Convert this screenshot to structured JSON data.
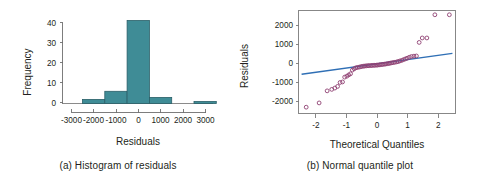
{
  "figure": {
    "background": "#ffffff",
    "bar_color": "#3f8c96",
    "bar_edge_color": "#2a5f68",
    "point_edge_color": "#8e3f72",
    "reference_line_color": "#2f6fb5",
    "axis_color": "#6f6f6f",
    "text_color": "#231f20"
  },
  "chart_data": [
    {
      "type": "bar",
      "panel": "a",
      "title": "",
      "caption": "(a) Histogram of residuals",
      "xlabel": "Residuals",
      "ylabel": "Frequency",
      "xlim": [
        -3500,
        3500
      ],
      "ylim": [
        0,
        43
      ],
      "grid": false,
      "legend": "none",
      "xticks": [
        -3000,
        -2000,
        -1000,
        0,
        1000,
        2000,
        3000
      ],
      "xtick_labels": [
        "-3000",
        "-2000",
        "-1000",
        "0",
        "1000",
        "2000",
        "3000"
      ],
      "yticks": [
        0,
        10,
        20,
        30,
        40
      ],
      "ytick_labels": [
        "0",
        "10",
        "20",
        "30",
        "40"
      ],
      "bin_width": 1000,
      "bin_edges": [
        -2500,
        -1500,
        -500,
        500,
        1500,
        2500,
        3500
      ],
      "categories": [
        "-2500 to -1500",
        "-1500 to -500",
        "-500 to 500",
        "500 to 1500",
        "1500 to 2500",
        "2500 to 3500"
      ],
      "values": [
        2,
        6,
        41,
        3,
        0,
        1
      ]
    },
    {
      "type": "scatter",
      "panel": "b",
      "title": "",
      "caption": "(b) Normal quantile plot",
      "xlabel": "Theoretical Quantiles",
      "ylabel": "Residuals",
      "xlim": [
        -2.55,
        2.55
      ],
      "ylim": [
        -2600,
        2950
      ],
      "grid": false,
      "legend": "none",
      "xticks": [
        -2,
        -1,
        0,
        1,
        2
      ],
      "xtick_labels": [
        "-2",
        "-1",
        "0",
        "1",
        "2"
      ],
      "yticks": [
        -2000,
        -1000,
        0,
        1000,
        2000
      ],
      "ytick_labels": [
        "-2000",
        "-1000",
        "0",
        "1000",
        "2000"
      ],
      "reference_line": {
        "x": [
          -2.45,
          2.45
        ],
        "y": [
          -480,
          640
        ]
      },
      "series": [
        {
          "name": "residual quantiles",
          "x": [
            -2.3,
            -1.88,
            -1.62,
            -1.47,
            -1.37,
            -1.28,
            -1.2,
            -1.12,
            -1.05,
            -0.98,
            -0.92,
            -0.86,
            -0.8,
            -0.74,
            -0.69,
            -0.64,
            -0.58,
            -0.53,
            -0.48,
            -0.43,
            -0.39,
            -0.34,
            -0.29,
            -0.25,
            -0.2,
            -0.16,
            -0.11,
            -0.07,
            -0.02,
            0.02,
            0.07,
            0.11,
            0.16,
            0.2,
            0.25,
            0.29,
            0.34,
            0.39,
            0.43,
            0.48,
            0.53,
            0.58,
            0.64,
            0.69,
            0.74,
            0.8,
            0.86,
            0.92,
            0.98,
            1.05,
            1.12,
            1.2,
            1.28,
            1.37,
            1.47,
            1.62,
            1.88,
            2.35
          ],
          "y": [
            -2260,
            -2030,
            -1380,
            -1300,
            -1230,
            -1140,
            -930,
            -900,
            -640,
            -590,
            -520,
            -460,
            -260,
            -190,
            -140,
            -120,
            -100,
            -80,
            -60,
            -50,
            -40,
            -30,
            -25,
            -20,
            -15,
            -10,
            -5,
            0,
            5,
            10,
            20,
            30,
            40,
            50,
            60,
            70,
            85,
            100,
            115,
            130,
            145,
            160,
            180,
            200,
            230,
            260,
            300,
            340,
            380,
            430,
            470,
            490,
            500,
            1230,
            1470,
            1470,
            2720,
            2720
          ]
        }
      ]
    }
  ],
  "panel_a": {
    "ylabel": "Frequency",
    "xlabel": "Residuals",
    "caption": "(a) Histogram of residuals",
    "ytick_labels": [
      "40",
      "30",
      "20",
      "10",
      "0"
    ],
    "xtick_labels": [
      "-3000",
      "-2000",
      "-1000",
      "0",
      "1000",
      "2000",
      "3000"
    ]
  },
  "panel_b": {
    "ylabel": "Residuals",
    "xlabel": "Theoretical Quantiles",
    "caption": "(b) Normal quantile plot",
    "ytick_labels": [
      "2000",
      "1000",
      "0",
      "-1000",
      "-2000"
    ],
    "xtick_labels": [
      "-2",
      "-1",
      "0",
      "1",
      "2"
    ]
  }
}
